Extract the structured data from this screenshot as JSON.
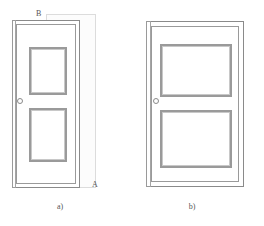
{
  "figure": {
    "type": "technical-line-drawing",
    "background_color": "#ffffff",
    "line_color": "#9a9a9a",
    "overlay_color": "#dcdcdc",
    "text_color": "#555555"
  },
  "panels": [
    {
      "id": "a",
      "caption": "a)",
      "door": {
        "name": "narrow-door",
        "frame_outer": {
          "x": 12,
          "y": 20,
          "w": 68,
          "h": 168
        },
        "frame_inner": {
          "x": 16,
          "y": 24,
          "w": 60,
          "h": 160
        },
        "edge_strip": {
          "x": 12,
          "y": 20,
          "w": 4,
          "h": 168
        },
        "panels": [
          {
            "name": "upper-panel",
            "x": 29,
            "y": 47,
            "w": 38,
            "h": 48
          },
          {
            "name": "lower-panel",
            "x": 29,
            "y": 108,
            "w": 38,
            "h": 54
          }
        ],
        "knob": {
          "x": 17,
          "y": 98,
          "d": 4
        }
      },
      "overlay": {
        "name": "reference-rectangle",
        "x": 46,
        "y": 14,
        "w": 50,
        "h": 174
      },
      "labels": [
        {
          "text": "B",
          "x": 36,
          "y": 10,
          "name": "label-b"
        },
        {
          "text": "A",
          "x": 92,
          "y": 181,
          "name": "label-a"
        }
      ]
    },
    {
      "id": "b",
      "caption": "b)",
      "door": {
        "name": "wide-door",
        "frame_outer": {
          "x": 146,
          "y": 21,
          "w": 98,
          "h": 166
        },
        "frame_inner": {
          "x": 151,
          "y": 26,
          "w": 88,
          "h": 156
        },
        "edge_strip": {
          "x": 146,
          "y": 21,
          "w": 5,
          "h": 166
        },
        "panels": [
          {
            "name": "upper-panel",
            "x": 160,
            "y": 44,
            "w": 72,
            "h": 53
          },
          {
            "name": "lower-panel",
            "x": 160,
            "y": 110,
            "w": 72,
            "h": 58
          }
        ],
        "knob": {
          "x": 153,
          "y": 98,
          "d": 4
        }
      },
      "labels": []
    }
  ],
  "captions": {
    "a": {
      "text": "a)",
      "x": 40,
      "y": 203,
      "w": 40
    },
    "b": {
      "text": "b)",
      "x": 172,
      "y": 203,
      "w": 40
    }
  }
}
